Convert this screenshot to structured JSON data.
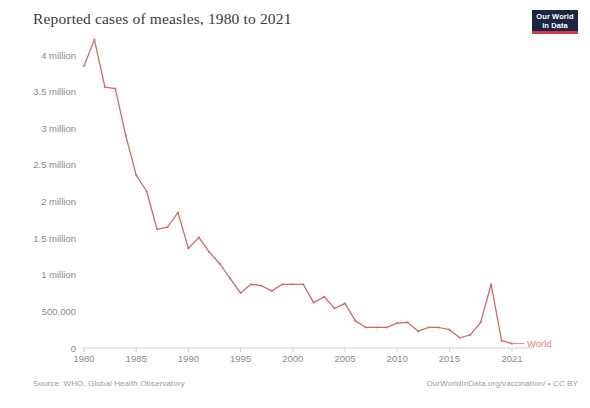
{
  "header": {
    "title": "Reported cases of measles, 1980 to 2021",
    "logo_line1": "Our World",
    "logo_line2": "in Data"
  },
  "footer": {
    "source": "Source: WHO, Global Health Observatory",
    "attribution": "OurWorldInData.org/vaccination/ • CC BY"
  },
  "colors": {
    "series_line": "#d9635f",
    "series_label": "#e8837f",
    "axis": "#cfcfcf",
    "tick_text": "#8a8a8a",
    "title_text": "#3a3a3a",
    "logo_background": "#1d2640",
    "logo_underline": "#d9344b"
  },
  "chart_data": {
    "type": "line",
    "title": "Reported cases of measles, 1980 to 2021",
    "xlabel": "",
    "ylabel": "",
    "xlim": [
      1980,
      2021
    ],
    "ylim": [
      0,
      4250000
    ],
    "grid": false,
    "legend_position": "line-end-right",
    "y_ticks": [
      0,
      500000,
      1000000,
      1500000,
      2000000,
      2500000,
      3000000,
      3500000,
      4000000
    ],
    "y_tick_labels": [
      "0",
      "500,000",
      "1 million",
      "1.5 million",
      "2 million",
      "2.5 million",
      "3 million",
      "3.5 million",
      "4 million"
    ],
    "x_ticks": [
      1980,
      1985,
      1990,
      1995,
      2000,
      2005,
      2010,
      2015,
      2021
    ],
    "x_tick_labels": [
      "1980",
      "1985",
      "1990",
      "1995",
      "2000",
      "2005",
      "2010",
      "2015",
      "2021"
    ],
    "series": [
      {
        "name": "World",
        "color": "#d9635f",
        "x": [
          1980,
          1981,
          1982,
          1983,
          1984,
          1985,
          1986,
          1987,
          1988,
          1989,
          1990,
          1991,
          1992,
          1993,
          1994,
          1995,
          1996,
          1997,
          1998,
          1999,
          2000,
          2001,
          2002,
          2003,
          2004,
          2005,
          2006,
          2007,
          2008,
          2009,
          2010,
          2011,
          2012,
          2013,
          2014,
          2015,
          2016,
          2017,
          2018,
          2019,
          2020,
          2021
        ],
        "values": [
          3850000,
          4210000,
          3560000,
          3540000,
          2900000,
          2360000,
          2140000,
          1620000,
          1650000,
          1850000,
          1360000,
          1510000,
          1310000,
          1150000,
          950000,
          750000,
          870000,
          850000,
          780000,
          870000,
          870000,
          870000,
          620000,
          700000,
          540000,
          610000,
          370000,
          280000,
          280000,
          280000,
          340000,
          350000,
          230000,
          280000,
          280000,
          250000,
          140000,
          180000,
          350000,
          870000,
          100000,
          60000
        ]
      }
    ]
  }
}
